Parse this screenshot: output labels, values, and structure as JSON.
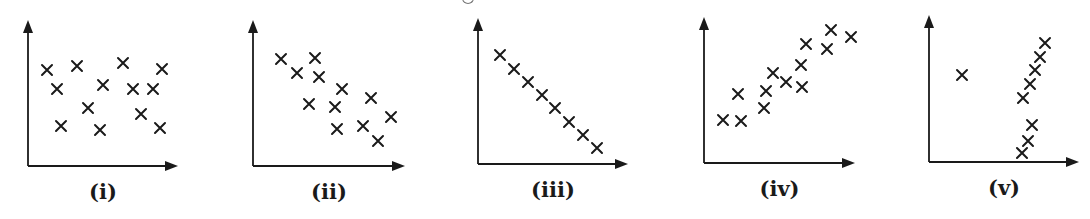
{
  "figure": {
    "ink_color": "#1a1a1a",
    "background": "#ffffff"
  },
  "chart_data": [
    {
      "type": "scatter",
      "title": "",
      "caption": "(i)",
      "description": "No correlation",
      "xlabel": "",
      "ylabel": "",
      "grid": false,
      "axes": {
        "origin": [
          28,
          166
        ],
        "x_end": 178,
        "y_top": 20
      },
      "points_px": [
        [
          47,
          70
        ],
        [
          77,
          66
        ],
        [
          123,
          63
        ],
        [
          162,
          69
        ],
        [
          57,
          89
        ],
        [
          103,
          85
        ],
        [
          133,
          89
        ],
        [
          153,
          89
        ],
        [
          88,
          108
        ],
        [
          141,
          114
        ],
        [
          61,
          126
        ],
        [
          100,
          130
        ],
        [
          160,
          128
        ]
      ]
    },
    {
      "type": "scatter",
      "title": "",
      "caption": "(ii)",
      "description": "Weak negative correlation",
      "xlabel": "",
      "ylabel": "",
      "grid": false,
      "axes": {
        "origin": [
          253,
          166
        ],
        "x_end": 405,
        "y_top": 20
      },
      "points_px": [
        [
          281,
          59
        ],
        [
          297,
          73
        ],
        [
          315,
          58
        ],
        [
          319,
          77
        ],
        [
          342,
          89
        ],
        [
          309,
          104
        ],
        [
          335,
          107
        ],
        [
          371,
          98
        ],
        [
          391,
          117
        ],
        [
          337,
          129
        ],
        [
          363,
          126
        ],
        [
          378,
          141
        ]
      ]
    },
    {
      "type": "scatter",
      "title": "",
      "caption": "(iii)",
      "description": "Perfect negative linear correlation",
      "xlabel": "",
      "ylabel": "",
      "grid": false,
      "axes": {
        "origin": [
          478,
          164
        ],
        "x_end": 628,
        "y_top": 18
      },
      "points_px": [
        [
          500,
          55
        ],
        [
          514,
          69
        ],
        [
          528,
          82
        ],
        [
          542,
          95
        ],
        [
          555,
          108
        ],
        [
          569,
          122
        ],
        [
          583,
          135
        ],
        [
          597,
          148
        ]
      ]
    },
    {
      "type": "scatter",
      "title": "",
      "caption": "(iv)",
      "description": "Strong positive correlation",
      "xlabel": "",
      "ylabel": "",
      "grid": false,
      "axes": {
        "origin": [
          704,
          163
        ],
        "x_end": 855,
        "y_top": 17
      },
      "points_px": [
        [
          723,
          120
        ],
        [
          741,
          121
        ],
        [
          738,
          94
        ],
        [
          764,
          108
        ],
        [
          766,
          91
        ],
        [
          773,
          73
        ],
        [
          786,
          82
        ],
        [
          802,
          87
        ],
        [
          801,
          65
        ],
        [
          806,
          44
        ],
        [
          827,
          49
        ],
        [
          831,
          30
        ],
        [
          851,
          37
        ]
      ]
    },
    {
      "type": "scatter",
      "title": "",
      "caption": "(v)",
      "description": "Strong positive correlation with one outlier",
      "xlabel": "",
      "ylabel": "",
      "grid": false,
      "axes": {
        "origin": [
          929,
          162
        ],
        "x_end": 1079,
        "y_top": 15
      },
      "points_px": [
        [
          962,
          75
        ],
        [
          1022,
          153
        ],
        [
          1028,
          141
        ],
        [
          1032,
          125
        ],
        [
          1023,
          98
        ],
        [
          1030,
          84
        ],
        [
          1035,
          70
        ],
        [
          1040,
          57
        ],
        [
          1045,
          43
        ]
      ]
    }
  ]
}
